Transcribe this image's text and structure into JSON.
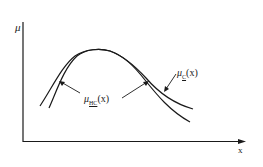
{
  "diagram": {
    "y_axis_label": "μ",
    "x_axis_label": "x",
    "curves": [
      {
        "id": "outer",
        "name": "μ_C(x)",
        "symbol": "μ",
        "subscript": "C",
        "arg": "(x)"
      },
      {
        "id": "inner",
        "name": "μ_HC(x)",
        "symbol": "μ",
        "subscript": "HC",
        "arg": "(x)"
      }
    ],
    "colors": {
      "ink": "#1a1a1a",
      "background": "#ffffff"
    }
  },
  "labels": {
    "mu_c": {
      "symbol": "μ",
      "sub": "C",
      "arg": "(x)"
    },
    "mu_hc": {
      "symbol": "μ",
      "sub": "HC",
      "arg": "(x)"
    }
  }
}
